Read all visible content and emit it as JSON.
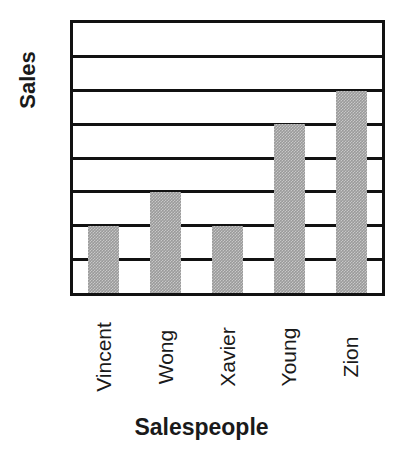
{
  "chart_data": {
    "type": "bar",
    "title": "",
    "subtitle": "",
    "xlabel": "Salespeople",
    "ylabel": "Sales",
    "categories": [
      "Vincent",
      "Wong",
      "Xavier",
      "Young",
      "Zion"
    ],
    "values": [
      2,
      3,
      2,
      5,
      6
    ],
    "ylim": [
      0,
      8
    ],
    "xlim": [
      0,
      5
    ],
    "y_tick_labels": [],
    "x_tick_labels": [
      "Vincent",
      "Wong",
      "Xavier",
      "Young",
      "Zion"
    ],
    "gridlines": {
      "horizontal": true,
      "vertical": false,
      "count": 7,
      "values": [
        1,
        2,
        3,
        4,
        5,
        6,
        7
      ]
    },
    "legend": {
      "visible": false,
      "position": "none",
      "entries": []
    },
    "series": [
      {
        "name": "Sales",
        "values": [
          2,
          3,
          2,
          5,
          6
        ],
        "color": "#9a9a9a"
      }
    ],
    "annotations": [],
    "data_labels": false,
    "axis_tick_labels_rotated": true,
    "bar_fill_pattern": "dithered-halftone-gray"
  },
  "colors": {
    "bar_fill": "#9a9a9a",
    "axis_line": "#111111",
    "gridline": "#111111",
    "plot_background": "#ffffff",
    "page_background": "#ffffff",
    "text": "#1a1a1a"
  },
  "axes": {
    "y_title": "Sales",
    "x_title": "Salespeople"
  }
}
